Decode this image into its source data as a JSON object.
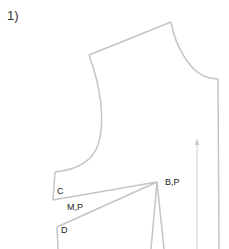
{
  "step": "1)",
  "labels": {
    "c": "C",
    "mp": "M,P",
    "bp": "B,P",
    "d": "D"
  },
  "colors": {
    "outline": "#c4c4c4",
    "grain": "#d0d0d0",
    "text": "#222222"
  }
}
